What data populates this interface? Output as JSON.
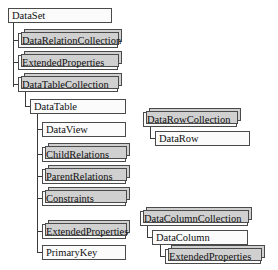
{
  "diagram": {
    "colors": {
      "box_fill": "#fbfbfb",
      "stack_fill": "#d0d0d0",
      "border": "#4a4a4a",
      "line": "#3a3a3a",
      "text": "#111111"
    },
    "nodes": [
      {
        "id": "dataset",
        "label": "DataSet",
        "style": "plain",
        "x": 8,
        "y": 8,
        "w": 104
      },
      {
        "id": "datarelationcollection",
        "label": "DataRelationCollection",
        "style": "stacked",
        "x": 18,
        "y": 33,
        "w": 100
      },
      {
        "id": "extendedproperties-ds",
        "label": "ExtendedProperties",
        "style": "stacked",
        "x": 18,
        "y": 55,
        "w": 100
      },
      {
        "id": "datatablecollection",
        "label": "DataTableCollection",
        "style": "stacked",
        "x": 18,
        "y": 77,
        "w": 100
      },
      {
        "id": "datatable",
        "label": "DataTable",
        "style": "plain",
        "x": 30,
        "y": 99,
        "w": 96
      },
      {
        "id": "dataview",
        "label": "DataView",
        "style": "plain",
        "x": 42,
        "y": 122,
        "w": 84
      },
      {
        "id": "childrelations",
        "label": "ChildRelations",
        "style": "stacked",
        "x": 42,
        "y": 147,
        "w": 84
      },
      {
        "id": "parentrelations",
        "label": "ParentRelations",
        "style": "stacked",
        "x": 42,
        "y": 169,
        "w": 84
      },
      {
        "id": "constraints",
        "label": "Constraints",
        "style": "stacked",
        "x": 42,
        "y": 191,
        "w": 84
      },
      {
        "id": "extendedproperties-dt",
        "label": "ExtendedProperties",
        "style": "stacked",
        "x": 42,
        "y": 224,
        "w": 84
      },
      {
        "id": "primarykey",
        "label": "PrimaryKey",
        "style": "plain",
        "x": 42,
        "y": 245,
        "w": 84
      },
      {
        "id": "datarowcollection",
        "label": "DataRowCollection",
        "style": "stacked",
        "x": 143,
        "y": 112,
        "w": 94
      },
      {
        "id": "datarow",
        "label": "DataRow",
        "style": "plain",
        "x": 155,
        "y": 131,
        "w": 95
      },
      {
        "id": "datacolumncollection",
        "label": "DataColumnCollection",
        "style": "stacked",
        "x": 140,
        "y": 211,
        "w": 108
      },
      {
        "id": "datacolumn",
        "label": "DataColumn",
        "style": "plain",
        "x": 152,
        "y": 230,
        "w": 96
      },
      {
        "id": "extendedproperties-dc",
        "label": "ExtendedProperties",
        "style": "stacked",
        "x": 165,
        "y": 249,
        "w": 96
      }
    ]
  }
}
